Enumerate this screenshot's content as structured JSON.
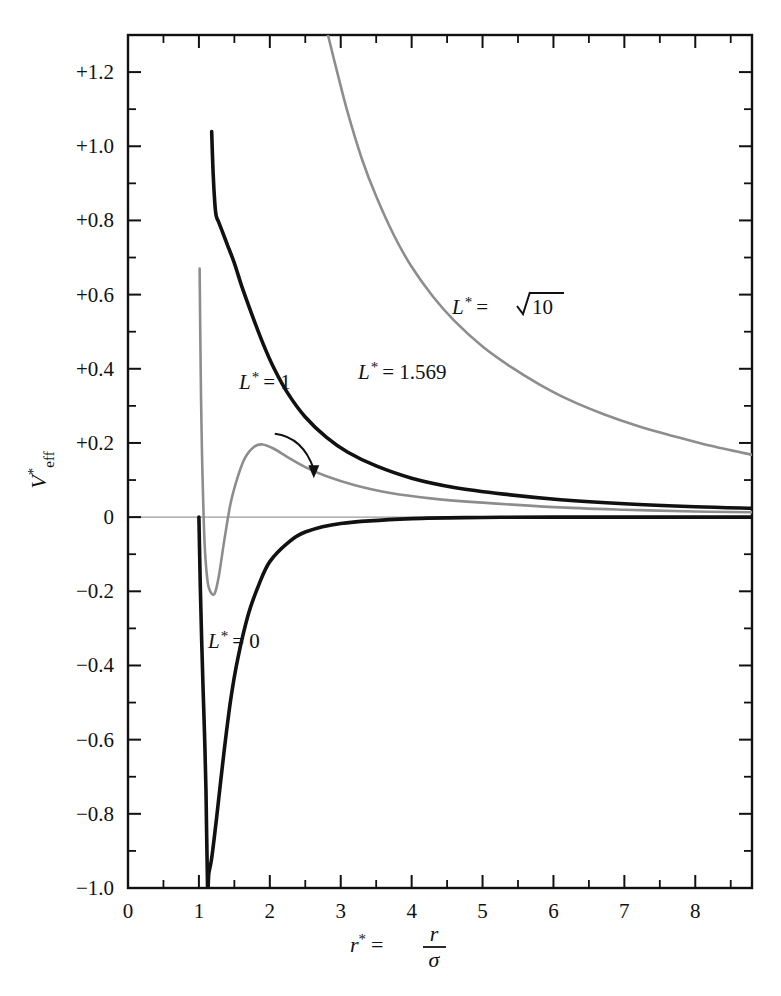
{
  "figure": {
    "title": "",
    "background": "#ffffff"
  },
  "chart_data": {
    "type": "line",
    "title": "",
    "subtitle": "",
    "xlabel": "r* = r/σ",
    "ylabel": "V*eff",
    "xlim": [
      0,
      8.8
    ],
    "ylim": [
      -1.0,
      1.3
    ],
    "grid": false,
    "legend_position": "inline-annotations",
    "x_major_ticks": [
      0,
      1,
      2,
      3,
      4,
      5,
      6,
      7,
      8
    ],
    "x_tick_labels": [
      "0",
      "1",
      "2",
      "3",
      "4",
      "5",
      "6",
      "7",
      "8"
    ],
    "x_minor_step": 0.5,
    "y_major_ticks": [
      1.2,
      1.0,
      0.8,
      0.6,
      0.4,
      0.2,
      0,
      -0.2,
      -0.4,
      -0.6,
      -0.8,
      -1.0
    ],
    "y_tick_labels": [
      "+1.2",
      "+1.0",
      "+0.8",
      "+0.6",
      "+0.4",
      "+0.2",
      "0",
      "−0.2",
      "−0.4",
      "−0.6",
      "−0.8",
      "−1.0"
    ],
    "y_minor_step": 0.1,
    "zero_reference_line": 0,
    "model": "V*eff(r*) = 4[(1/r*)^12 - (1/r*)^6] + L*^2 / (2 r*^2)",
    "series": [
      {
        "name": "L* = 0",
        "label": "L* = 0",
        "L": 0,
        "color": "#111111",
        "linewidth": 3.6,
        "style": "solid",
        "label_x": 2.1,
        "label_y": -0.46,
        "features": {
          "minimum_r": 1.122,
          "minimum_V": -1.0,
          "zero_crossing_r": 1.0,
          "asymptote_V": 0.0
        },
        "points": [
          [
            1.0,
            0.0
          ],
          [
            1.02,
            -0.19
          ],
          [
            1.04,
            -0.34
          ],
          [
            1.06,
            -0.47
          ],
          [
            1.08,
            -0.59
          ],
          [
            1.1,
            -0.74
          ],
          [
            1.122,
            -1.0
          ],
          [
            1.14,
            -0.96
          ],
          [
            1.18,
            -0.92
          ],
          [
            1.25,
            -0.81
          ],
          [
            1.35,
            -0.64
          ],
          [
            1.45,
            -0.49
          ],
          [
            1.55,
            -0.38
          ],
          [
            1.7,
            -0.26
          ],
          [
            1.85,
            -0.18
          ],
          [
            2.0,
            -0.12
          ],
          [
            2.25,
            -0.07
          ],
          [
            2.5,
            -0.04
          ],
          [
            3.0,
            -0.017
          ],
          [
            4.0,
            -0.004
          ],
          [
            5.0,
            -0.001
          ],
          [
            6.0,
            0.0
          ],
          [
            8.8,
            0.0
          ]
        ]
      },
      {
        "name": "L* = 1",
        "label": "L* = 1",
        "L": 1,
        "color": "#8d8d8d",
        "linewidth": 2.6,
        "style": "solid",
        "label_x": 1.72,
        "label_y": 0.255,
        "arrow_from": [
          2.07,
          0.225
        ],
        "arrow_to": [
          2.62,
          0.105
        ],
        "features": {
          "minimum_r": 1.22,
          "minimum_V": -0.207,
          "maximum_r": 1.9,
          "maximum_V": 0.196,
          "asymptote_V": 0.0
        },
        "points": [
          [
            1.01,
            0.67
          ],
          [
            1.03,
            0.32
          ],
          [
            1.05,
            0.12
          ],
          [
            1.08,
            -0.07
          ],
          [
            1.12,
            -0.17
          ],
          [
            1.16,
            -0.2
          ],
          [
            1.22,
            -0.207
          ],
          [
            1.28,
            -0.16
          ],
          [
            1.36,
            -0.06
          ],
          [
            1.45,
            0.04
          ],
          [
            1.55,
            0.11
          ],
          [
            1.65,
            0.16
          ],
          [
            1.78,
            0.19
          ],
          [
            1.9,
            0.196
          ],
          [
            2.05,
            0.185
          ],
          [
            2.25,
            0.162
          ],
          [
            2.5,
            0.135
          ],
          [
            2.8,
            0.11
          ],
          [
            3.2,
            0.086
          ],
          [
            3.7,
            0.065
          ],
          [
            4.3,
            0.05
          ],
          [
            5.0,
            0.039
          ],
          [
            6.0,
            0.027
          ],
          [
            7.0,
            0.02
          ],
          [
            8.0,
            0.015
          ],
          [
            8.8,
            0.013
          ]
        ]
      },
      {
        "name": "L* = 1.569",
        "label": "L* = 1.569",
        "L": 1.569,
        "color": "#111111",
        "linewidth": 3.6,
        "style": "solid",
        "label_x": 3.42,
        "label_y": 0.295,
        "features": {
          "inflection_r": 1.244,
          "inflection_V": 0.8,
          "curve_start_r": 1.18,
          "curve_start_V": 1.04,
          "asymptote_V": 0.0
        },
        "points": [
          [
            1.18,
            1.04
          ],
          [
            1.2,
            0.93
          ],
          [
            1.225,
            0.845
          ],
          [
            1.244,
            0.812
          ],
          [
            1.28,
            0.795
          ],
          [
            1.32,
            0.775
          ],
          [
            1.4,
            0.735
          ],
          [
            1.5,
            0.685
          ],
          [
            1.6,
            0.625
          ],
          [
            1.75,
            0.545
          ],
          [
            1.9,
            0.47
          ],
          [
            2.05,
            0.405
          ],
          [
            2.25,
            0.335
          ],
          [
            2.5,
            0.27
          ],
          [
            2.8,
            0.215
          ],
          [
            3.1,
            0.175
          ],
          [
            3.5,
            0.138
          ],
          [
            4.0,
            0.105
          ],
          [
            4.6,
            0.08
          ],
          [
            5.3,
            0.062
          ],
          [
            6.1,
            0.047
          ],
          [
            7.0,
            0.036
          ],
          [
            8.0,
            0.028
          ],
          [
            8.8,
            0.024
          ]
        ]
      },
      {
        "name": "L* = sqrt(10)",
        "label": "L* = √10",
        "L": 3.1623,
        "color": "#8d8d8d",
        "linewidth": 2.6,
        "style": "solid",
        "label_x": 5.1,
        "label_y": 0.595,
        "features": {
          "enters_top_at_r": 2.82,
          "asymptote_V": 0.0,
          "monotonic": "decreasing"
        },
        "points": [
          [
            2.82,
            1.3
          ],
          [
            2.95,
            1.2
          ],
          [
            3.1,
            1.09
          ],
          [
            3.3,
            0.965
          ],
          [
            3.5,
            0.865
          ],
          [
            3.75,
            0.76
          ],
          [
            4.0,
            0.675
          ],
          [
            4.3,
            0.595
          ],
          [
            4.6,
            0.53
          ],
          [
            5.0,
            0.46
          ],
          [
            5.4,
            0.405
          ],
          [
            5.8,
            0.358
          ],
          [
            6.2,
            0.318
          ],
          [
            6.7,
            0.278
          ],
          [
            7.2,
            0.245
          ],
          [
            7.7,
            0.218
          ],
          [
            8.2,
            0.193
          ],
          [
            8.8,
            0.168
          ]
        ]
      }
    ]
  },
  "annotations": {
    "label_L0": {
      "text_L": "L",
      "star": "*",
      "eq": "= 0"
    },
    "label_L1": {
      "text_L": "L",
      "star": "*",
      "eq": "= 1"
    },
    "label_L1569": {
      "text_L": "L",
      "star": "*",
      "eq": "= 1.569"
    },
    "label_Lsqrt10": {
      "text_L": "L",
      "star": "*",
      "eq": "=",
      "radicand": "10"
    },
    "ylabel_parts": {
      "base": "V",
      "sup": "*",
      "sub": "eff"
    },
    "xlabel_parts": {
      "base": "r",
      "sup": "*",
      "eq": "=",
      "num": "r",
      "den": "σ"
    }
  }
}
